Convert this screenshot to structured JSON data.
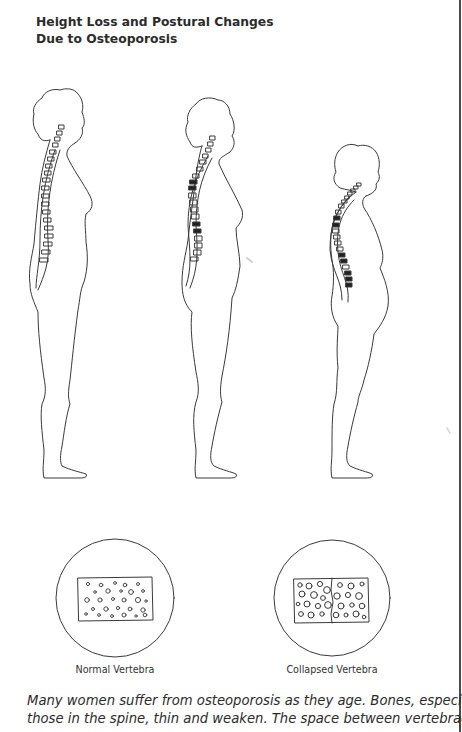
{
  "title": {
    "line1": "Height Loss and Postural Changes",
    "line2": "Due to Osteoporosis"
  },
  "figures": [
    {
      "name": "normal-posture-figure",
      "stage": "normal",
      "collapsed_vertebrae": 0
    },
    {
      "name": "moderate-osteoporosis-figure",
      "stage": "moderate",
      "collapsed_vertebrae": 5
    },
    {
      "name": "severe-osteoporosis-figure",
      "stage": "severe",
      "collapsed_vertebrae": 7
    }
  ],
  "vertebra_insets": {
    "normal_label": "Normal Vertebra",
    "collapsed_label": "Collapsed Vertebra"
  },
  "caption": {
    "line1": "Many women suffer from osteoporosis as they age. Bones, especially",
    "line2": "those in the spine, thin and weaken. The space between vertebrae de-"
  },
  "colors": {
    "line": "#3a3a3a",
    "text": "#2b2b2b",
    "background": "#ffffff"
  }
}
